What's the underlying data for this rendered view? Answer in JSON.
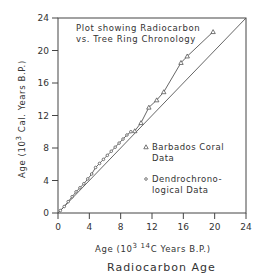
{
  "chart_data": {
    "type": "line",
    "title": "Plot showing Radiocarbon vs. Tree Ring Chronology",
    "annotation_lines": [
      "Plot showing Radiocarbon",
      "vs. Tree Ring Chronology"
    ],
    "xlabel": "Age (10^3 14C Years B.P.)",
    "xlabel_parts": {
      "prefix": "Age (10",
      "sup1": "3",
      "sup2": "14",
      "suffix": "C Years B.P.)"
    },
    "ylabel": "Age (10^3 Cal. Years B.P.)",
    "ylabel_parts": {
      "prefix": "Age (10",
      "sup": "3",
      "suffix": " Cal. Years B.P.)"
    },
    "subtitle": "Radiocarbon Age",
    "xlim": [
      0,
      24
    ],
    "ylim": [
      0,
      24
    ],
    "xticks": [
      0,
      4,
      8,
      12,
      16,
      20,
      24
    ],
    "yticks": [
      0,
      4,
      8,
      12,
      16,
      20,
      24
    ],
    "grid": false,
    "legend_position": "lower right inside",
    "series": [
      {
        "name": "1:1 reference line",
        "marker": "none",
        "x": [
          0,
          24
        ],
        "y": [
          0,
          24
        ]
      },
      {
        "name": "Barbados Coral Data",
        "marker": "triangle",
        "x": [
          9.8,
          10.6,
          11.6,
          12.6,
          13.5,
          15.7,
          16.5,
          19.8
        ],
        "y": [
          10.1,
          11.1,
          13.0,
          13.9,
          14.9,
          18.5,
          19.3,
          22.3
        ]
      },
      {
        "name": "Dendrochronological Data",
        "marker": "circle",
        "x": [
          0.3,
          0.8,
          1.3,
          1.8,
          2.3,
          2.8,
          3.3,
          3.8,
          4.3,
          4.8,
          5.3,
          5.8,
          6.3,
          6.8,
          7.3,
          7.8,
          8.3,
          8.8,
          9.3
        ],
        "y": [
          0.3,
          0.8,
          1.4,
          2.0,
          2.6,
          3.1,
          3.6,
          4.2,
          4.8,
          5.6,
          6.1,
          6.6,
          7.1,
          7.6,
          8.1,
          8.6,
          9.1,
          9.6,
          10.0
        ]
      }
    ],
    "legend": [
      {
        "marker": "triangle",
        "lines": [
          "Barbados Coral",
          "Data"
        ]
      },
      {
        "marker": "circle",
        "lines": [
          "Dendrochrono-",
          "logical Data"
        ]
      }
    ],
    "colors": {
      "line": "#555555",
      "axis": "#444444",
      "text": "#333333"
    }
  }
}
